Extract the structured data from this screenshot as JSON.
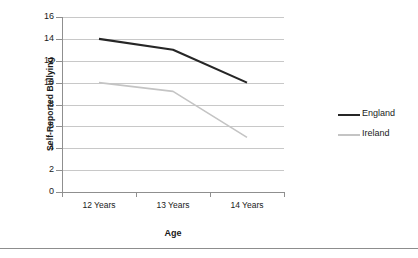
{
  "chart_data": {
    "type": "line",
    "title": "",
    "xlabel": "Age",
    "ylabel": "Self-Reported Bullying",
    "categories": [
      "12 Years",
      "13 Years",
      "14 Years"
    ],
    "series": [
      {
        "name": "England",
        "values": [
          14,
          13,
          10
        ],
        "color": "#262626"
      },
      {
        "name": "Ireland",
        "values": [
          10,
          9.2,
          5
        ],
        "color": "#c4c4c4"
      }
    ],
    "ylim": [
      0,
      16
    ],
    "ytick_step": 2,
    "yticks": [
      "0",
      "2",
      "4",
      "6",
      "8",
      "10",
      "12",
      "14",
      "16"
    ],
    "grid": true,
    "legend_position": "right",
    "axis_color": "#8f8f8f",
    "grid_color": "#c8c8c8"
  },
  "legend": {
    "entries": [
      {
        "label": "England",
        "color": "#262626"
      },
      {
        "label": "Ireland",
        "color": "#c4c4c4"
      }
    ]
  },
  "axes": {
    "y_title": "Self-Reported Bullying",
    "x_title": "Age"
  }
}
